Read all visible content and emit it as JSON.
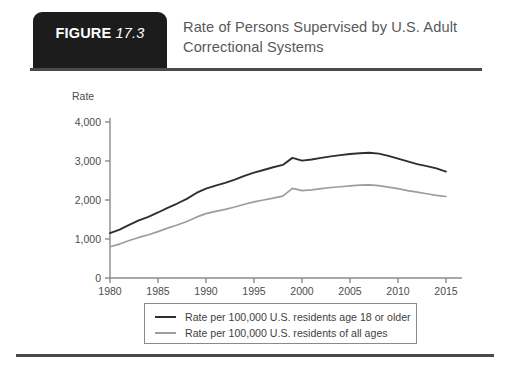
{
  "figure": {
    "badge_word": "FIGURE",
    "badge_number": "17.3",
    "title": "Rate of Persons Supervised by U.S. Adult Correctional Systems"
  },
  "colors": {
    "badge_background": "#1c1c1c",
    "title_text": "#58585a",
    "rule": "#4a4a4a",
    "series_adults": "#2f2f2f",
    "series_all_ages": "#9d9d9d",
    "axis": "#8a8a8a"
  },
  "chart_data": {
    "type": "line",
    "title": "Rate of Persons Supervised by U.S. Adult Correctional Systems",
    "xlabel": "",
    "ylabel": "Rate",
    "xlim": [
      1980,
      2015
    ],
    "ylim": [
      0,
      4000
    ],
    "grid": false,
    "legend_position": "bottom",
    "xticks": [
      "1980",
      "1985",
      "1990",
      "1995",
      "2000",
      "2005",
      "2010",
      "2015"
    ],
    "xtick_values": [
      1980,
      1985,
      1990,
      1995,
      2000,
      2005,
      2010,
      2015
    ],
    "yticks": [
      "0",
      "1,000",
      "2,000",
      "3,000",
      "4,000"
    ],
    "ytick_values": [
      0,
      1000,
      2000,
      3000,
      4000
    ],
    "x": [
      1980,
      1981,
      1982,
      1983,
      1984,
      1985,
      1986,
      1987,
      1988,
      1989,
      1990,
      1991,
      1992,
      1993,
      1994,
      1995,
      1996,
      1997,
      1998,
      1999,
      2000,
      2001,
      2002,
      2003,
      2004,
      2005,
      2006,
      2007,
      2008,
      2009,
      2010,
      2011,
      2012,
      2013,
      2014,
      2015
    ],
    "series": [
      {
        "name": "Rate per 100,000 U.S. residents age 18 or older",
        "color": "#2f2f2f",
        "values": [
          1150,
          1240,
          1360,
          1480,
          1570,
          1680,
          1800,
          1910,
          2030,
          2180,
          2290,
          2370,
          2440,
          2520,
          2620,
          2700,
          2770,
          2840,
          2900,
          3080,
          3010,
          3040,
          3080,
          3120,
          3150,
          3180,
          3200,
          3210,
          3190,
          3130,
          3060,
          2990,
          2920,
          2870,
          2810,
          2730
        ]
      },
      {
        "name": "Rate per 100,000 U.S. residents of all ages",
        "color": "#9d9d9d",
        "values": [
          800,
          870,
          960,
          1040,
          1110,
          1190,
          1280,
          1360,
          1450,
          1560,
          1650,
          1710,
          1760,
          1820,
          1890,
          1950,
          2000,
          2050,
          2100,
          2300,
          2240,
          2260,
          2290,
          2320,
          2340,
          2360,
          2380,
          2390,
          2370,
          2330,
          2290,
          2240,
          2200,
          2160,
          2120,
          2090
        ]
      }
    ]
  },
  "legend": {
    "items": [
      {
        "label": "Rate per 100,000 U.S. residents age 18 or older",
        "style": "dark"
      },
      {
        "label": "Rate per 100,000 U.S. residents of all ages",
        "style": "light"
      }
    ]
  }
}
